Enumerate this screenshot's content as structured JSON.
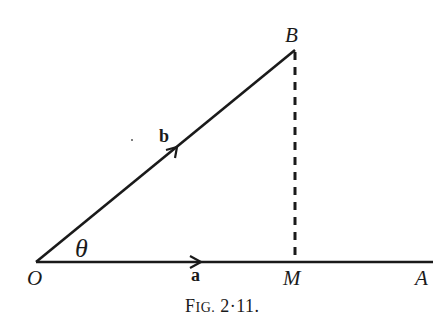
{
  "figure": {
    "caption": {
      "prefix": "F",
      "smallcaps": "IG.",
      "number": "2·11."
    },
    "points": {
      "O": {
        "label": "O",
        "x": 36,
        "y": 262
      },
      "B": {
        "label": "B",
        "x": 295,
        "y": 50
      },
      "M": {
        "label": "M",
        "x": 295,
        "y": 262
      },
      "A": {
        "label": "A",
        "x": 433,
        "y": 262
      }
    },
    "vectors": {
      "a": {
        "label": "a",
        "from": "O",
        "direction": "A",
        "style": "solid",
        "arrow_at_x": 200
      },
      "b": {
        "label": "b",
        "from": "O",
        "to": "B",
        "style": "solid"
      }
    },
    "segments": {
      "BM": {
        "from": "B",
        "to": "M",
        "style": "dashed"
      }
    },
    "angle": {
      "label": "θ",
      "between": [
        "a",
        "b"
      ],
      "vertex": "O"
    },
    "colors": {
      "ink": "#1a1a1a",
      "background": "#ffffff"
    }
  }
}
